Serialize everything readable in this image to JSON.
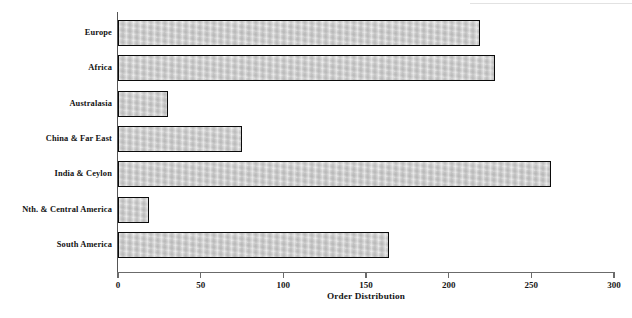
{
  "chart_data": {
    "type": "bar",
    "orientation": "horizontal",
    "title": "",
    "xlabel": "Order Distribution",
    "ylabel": "",
    "categories": [
      "Europe",
      "Africa",
      "Australasia",
      "China & Far East",
      "India & Ceylon",
      "Nth. & Central America",
      "South America"
    ],
    "values": [
      219,
      228,
      30,
      75,
      262,
      19,
      164
    ],
    "xlim": [
      0,
      300
    ],
    "xticks": [
      0,
      50,
      100,
      150,
      200,
      250,
      300
    ],
    "xtick_labels": [
      "0",
      "50",
      "100",
      "150",
      "200",
      "250",
      "300"
    ],
    "grid": false,
    "legend": null,
    "bar_fill_color": "#c9c9c9",
    "bar_border_color": "#0b0b0b",
    "axis_color": "#6b6b6b",
    "text_color": "#141414",
    "background_color": "#ffffff"
  }
}
